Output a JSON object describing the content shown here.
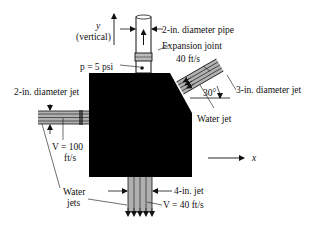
{
  "diagram": {
    "labels": {
      "y_axis": "y",
      "y_axis_note": "(vertical)",
      "x_axis": "x",
      "pipe": "2-in. diameter pipe",
      "expansion_joint": "Expansion joint",
      "pressure": "p = 5 psi",
      "jet_right_speed": "40 ft/s",
      "jet_right_diameter": "3-in. diameter jet",
      "angle": "30°",
      "water_jet_right": "Water jet",
      "jet_left_diameter": "2-in. diameter jet",
      "jet_left_speed_line1": "V = 100",
      "jet_left_speed_line2": "ft/s",
      "water_jets_line1": "Water",
      "water_jets_line2": "jets",
      "jet_bottom_diameter": "4-in. jet",
      "jet_bottom_speed": "V = 40 ft/s"
    },
    "colors": {
      "block": "#000000",
      "jet_fill": "#b0b0b0",
      "line": "#111111",
      "background": "#ffffff"
    },
    "components": [
      {
        "name": "block",
        "shape": "chamfered rectangle"
      },
      {
        "name": "vertical pipe",
        "diameter_in": 2,
        "pressure_psi": 5
      },
      {
        "name": "left jet",
        "diameter_in": 2,
        "velocity_fts": 100
      },
      {
        "name": "upper right jet",
        "diameter_in": 3,
        "velocity_fts": 40,
        "angle_deg": 30
      },
      {
        "name": "bottom jet",
        "diameter_in": 4,
        "velocity_fts": 40
      }
    ]
  }
}
